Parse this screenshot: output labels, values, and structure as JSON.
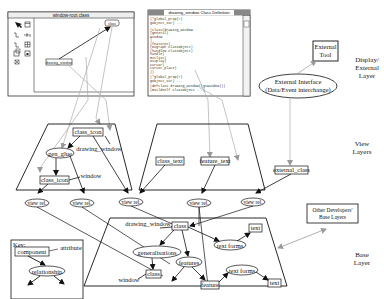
{
  "window_root": {
    "title": "window-root class",
    "nodes": [
      "class",
      "drawing_window"
    ]
  },
  "class_def_window": {
    "title": "drawing_window Class Definition",
    "code_lines": [
      "(*global_prop(?)",
      " gobject_var) ...",
      "",
      "(class(drawing_window",
      " (general)",
      "   window",
      " )",
      " (features)",
      "   (Digraph ClassObject)",
      "   (handlew ClassObject)",
      "   handle)",
      "   Bitlist)",
      "   Display)",
      "   Cursor)",
      "   cursor_place)",
      " ))",
      "",
      "(*global_prop(?)",
      " gobject_var) ...",
      "",
      "(defclass drawing_window((gtWindow)))",
      " (BuildSelf ClassObject ...)"
    ]
  },
  "external": {
    "tool": [
      "External",
      "Tool"
    ],
    "interface": [
      "External Interface",
      "(Data/Event interchange)"
    ]
  },
  "layers": {
    "display": [
      "Display/",
      "External",
      "Layer"
    ],
    "view": [
      "View",
      "Layers"
    ],
    "base": [
      "Base",
      "Layer"
    ]
  },
  "view_layer_1": {
    "class_icon_top": "class_icon",
    "gen_glue": "gen_glue",
    "drawing_window": "drawing_window",
    "class_icon_bottom": "class_icon",
    "window": "window"
  },
  "view_layer_2": {
    "class_text": "class_text",
    "feature_text": "feature_text"
  },
  "view_layer_3": {
    "external_class": "external_class"
  },
  "view_rels": [
    "view rel.",
    "view rel.",
    "view rel.",
    "view rel.",
    "view rel."
  ],
  "base_layer": {
    "class_top": "class",
    "drawing_window": "drawing_window",
    "generalisations": "generalisations",
    "class_bottom": "class",
    "window": "window",
    "features": "features",
    "feature": "feature",
    "text_forms_1": "text forms",
    "text_1": "text",
    "text_forms_2": "text forms",
    "text_2": "text"
  },
  "other_devs": [
    "Other Developers'",
    "Base Layers"
  ],
  "key": {
    "title": "Key:",
    "component": "component",
    "attribute": "attribute",
    "relationship": "relationship"
  }
}
